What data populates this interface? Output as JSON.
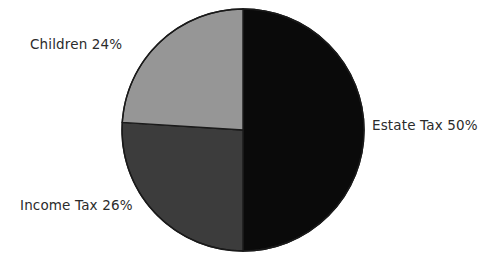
{
  "chart_data": {
    "type": "pie",
    "title": "",
    "subtitle": "",
    "xlabel": "",
    "ylabel": "",
    "legend_position": "none",
    "grid": false,
    "labels_position": "outside",
    "unit": "%",
    "categories": [
      "Estate Tax",
      "Income Tax",
      "Children"
    ],
    "values": [
      50,
      26,
      24
    ],
    "slices": [
      {
        "name": "Estate Tax",
        "value": 50,
        "label": "Estate Tax 50%",
        "color": "#0a0a0a",
        "start_angle_deg": 0,
        "end_angle_deg": 180
      },
      {
        "name": "Income Tax",
        "value": 26,
        "label": "Income Tax 26%",
        "color": "#3c3c3c",
        "start_angle_deg": 180,
        "end_angle_deg": 273.6
      },
      {
        "name": "Children",
        "value": 24,
        "label": "Children 24%",
        "color": "#969696",
        "start_angle_deg": 273.6,
        "end_angle_deg": 360
      }
    ],
    "geometry": {
      "center_x": 243,
      "center_y": 130,
      "radius": 121,
      "outline_color": "#1a1a1a",
      "outline_width": 1.4,
      "background": "#ffffff"
    }
  },
  "labels": {
    "children": "Children 24%",
    "income_tax": "Income Tax 26%",
    "estate_tax": "Estate Tax 50%"
  }
}
